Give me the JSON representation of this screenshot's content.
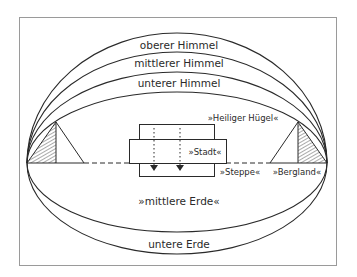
{
  "diagram": {
    "heavens": [
      {
        "label": "oberer Himmel"
      },
      {
        "label": "mittlerer Himmel"
      },
      {
        "label": "unterer Himmel"
      }
    ],
    "places": {
      "holy_hill": "»Heiliger Hügel«",
      "city": "»Stadt«",
      "steppe": "»Steppe«",
      "mountains": "»Bergland«"
    },
    "earths": {
      "middle": "»mittlere Erde«",
      "lower": "untere Erde"
    },
    "colors": {
      "line": "#2a2a2a",
      "frame": "#9a9a9a",
      "background": "#ffffff"
    }
  }
}
